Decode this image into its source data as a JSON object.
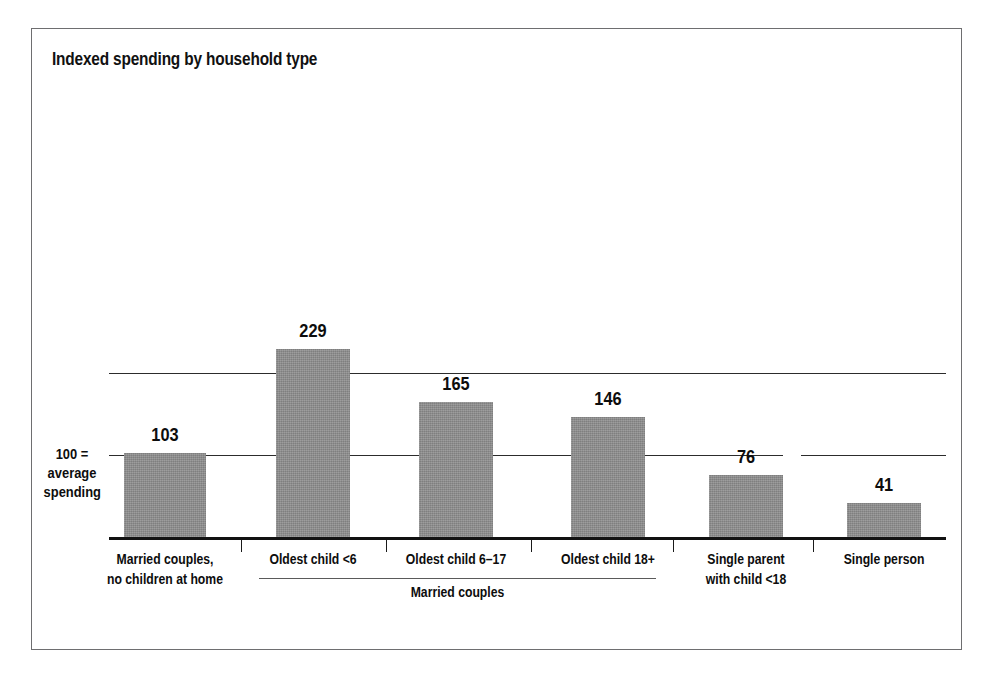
{
  "chart_data": {
    "type": "bar",
    "title": "Indexed spending by household type",
    "xlabel": "",
    "ylabel": "",
    "ylim": [
      0,
      240
    ],
    "grid": true,
    "gridlines": [
      100,
      200
    ],
    "legend": "none",
    "categories": [
      "Married couples, no children at home",
      "Oldest child <6",
      "Oldest child 6–17",
      "Oldest child 18+",
      "Single parent with child <18",
      "Single person"
    ],
    "values": [
      103,
      229,
      165,
      146,
      76,
      41
    ],
    "annotations": [
      "100 = average spending",
      "Married couples"
    ]
  },
  "chart": {
    "title": "Indexed spending by household type",
    "y_note": {
      "line1": "100 =",
      "line2": "average",
      "line3": "spending"
    },
    "bars": [
      {
        "value": 103,
        "value_label": "103",
        "label_line1": "Married couples,",
        "label_line2": "no children at home"
      },
      {
        "value": 229,
        "value_label": "229",
        "label_line1": "Oldest child <6",
        "label_line2": ""
      },
      {
        "value": 165,
        "value_label": "165",
        "label_line1": "Oldest child 6–17",
        "label_line2": ""
      },
      {
        "value": 146,
        "value_label": "146",
        "label_line1": "Oldest child 18+",
        "label_line2": ""
      },
      {
        "value": 76,
        "value_label": "76",
        "label_line1": "Single parent",
        "label_line2": "with child <18"
      },
      {
        "value": 41,
        "value_label": "41",
        "label_line1": "Single person",
        "label_line2": ""
      }
    ],
    "group_bracket": {
      "label": "Married couples"
    },
    "colors": {
      "bar_fill": "#8c8c8c",
      "axis": "#121212",
      "gridline": "#2c2c2c",
      "frame": "#6e6e70",
      "text": "#0d0d0d"
    }
  }
}
